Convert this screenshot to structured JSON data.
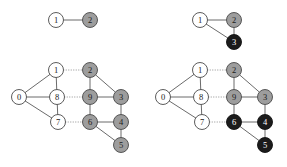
{
  "figure": {
    "background_color": "#ffffff",
    "width": 287,
    "height": 167,
    "palette": {
      "white_node_fill": "#ffffff",
      "gray_node_fill": "#9d9d9d",
      "black_node_fill": "#1b1b1b",
      "node_stroke": "#4a4a4a",
      "solid_edge": "#6b6b6b",
      "dotted_edge": "#9a9a9a",
      "label_on_light": "#1a1a1a",
      "label_on_dark": "#ffffff"
    }
  },
  "panels": [
    {
      "id": "top-left",
      "name": "graph-top-left",
      "origin": {
        "x": 0,
        "y": 0
      },
      "size": {
        "width": 143,
        "height": 55
      },
      "nodes": [
        {
          "id": "n1",
          "label": "1",
          "x": 56,
          "y": 20,
          "r": 7.5,
          "fill": "white"
        },
        {
          "id": "n2",
          "label": "2",
          "x": 90,
          "y": 20,
          "r": 7.5,
          "fill": "gray"
        }
      ],
      "edges": [
        {
          "from": "n1",
          "to": "n2",
          "style": "solid"
        }
      ]
    },
    {
      "id": "top-right",
      "name": "graph-top-right",
      "origin": {
        "x": 143,
        "y": 0
      },
      "size": {
        "width": 144,
        "height": 55
      },
      "nodes": [
        {
          "id": "n1",
          "label": "1",
          "x": 57,
          "y": 20,
          "r": 7.5,
          "fill": "white"
        },
        {
          "id": "n2",
          "label": "2",
          "x": 91,
          "y": 20,
          "r": 7.5,
          "fill": "gray"
        },
        {
          "id": "n3",
          "label": "3",
          "x": 91,
          "y": 42,
          "r": 7.5,
          "fill": "black"
        }
      ],
      "edges": [
        {
          "from": "n1",
          "to": "n2",
          "style": "solid"
        },
        {
          "from": "n1",
          "to": "n3",
          "style": "solid"
        },
        {
          "from": "n2",
          "to": "n3",
          "style": "solid"
        }
      ]
    },
    {
      "id": "bottom-left",
      "name": "graph-bottom-left",
      "origin": {
        "x": 0,
        "y": 55
      },
      "size": {
        "width": 143,
        "height": 112
      },
      "nodes": [
        {
          "id": "n0",
          "label": "0",
          "x": 19,
          "y": 42,
          "r": 7.5,
          "fill": "white"
        },
        {
          "id": "n1",
          "label": "1",
          "x": 56,
          "y": 15,
          "r": 7.5,
          "fill": "white"
        },
        {
          "id": "n8",
          "label": "8",
          "x": 57,
          "y": 42,
          "r": 7.5,
          "fill": "white"
        },
        {
          "id": "n7",
          "label": "7",
          "x": 58,
          "y": 67,
          "r": 7.5,
          "fill": "white"
        },
        {
          "id": "n2",
          "label": "2",
          "x": 90,
          "y": 15,
          "r": 7.5,
          "fill": "gray"
        },
        {
          "id": "n9",
          "label": "9",
          "x": 90,
          "y": 42,
          "r": 7.5,
          "fill": "gray"
        },
        {
          "id": "n3",
          "label": "3",
          "x": 121,
          "y": 42,
          "r": 7.5,
          "fill": "gray"
        },
        {
          "id": "n6",
          "label": "6",
          "x": 90,
          "y": 67,
          "r": 7.5,
          "fill": "gray"
        },
        {
          "id": "n4",
          "label": "4",
          "x": 121,
          "y": 67,
          "r": 7.5,
          "fill": "gray"
        },
        {
          "id": "n5",
          "label": "5",
          "x": 121,
          "y": 90,
          "r": 7.5,
          "fill": "gray"
        }
      ],
      "edges": [
        {
          "from": "n0",
          "to": "n1",
          "style": "solid"
        },
        {
          "from": "n0",
          "to": "n8",
          "style": "solid"
        },
        {
          "from": "n0",
          "to": "n7",
          "style": "solid"
        },
        {
          "from": "n1",
          "to": "n8",
          "style": "solid"
        },
        {
          "from": "n8",
          "to": "n7",
          "style": "solid"
        },
        {
          "from": "n1",
          "to": "n2",
          "style": "dotted"
        },
        {
          "from": "n8",
          "to": "n9",
          "style": "dotted"
        },
        {
          "from": "n7",
          "to": "n6",
          "style": "dotted"
        },
        {
          "from": "n2",
          "to": "n9",
          "style": "solid"
        },
        {
          "from": "n2",
          "to": "n3",
          "style": "solid"
        },
        {
          "from": "n9",
          "to": "n3",
          "style": "solid"
        },
        {
          "from": "n9",
          "to": "n6",
          "style": "solid"
        },
        {
          "from": "n3",
          "to": "n4",
          "style": "solid"
        },
        {
          "from": "n6",
          "to": "n4",
          "style": "solid"
        },
        {
          "from": "n6",
          "to": "n5",
          "style": "solid"
        },
        {
          "from": "n4",
          "to": "n5",
          "style": "solid"
        }
      ]
    },
    {
      "id": "bottom-right",
      "name": "graph-bottom-right",
      "origin": {
        "x": 143,
        "y": 55
      },
      "size": {
        "width": 144,
        "height": 112
      },
      "nodes": [
        {
          "id": "n0",
          "label": "0",
          "x": 20,
          "y": 42,
          "r": 7.5,
          "fill": "white"
        },
        {
          "id": "n1",
          "label": "1",
          "x": 57,
          "y": 15,
          "r": 7.5,
          "fill": "white"
        },
        {
          "id": "n8",
          "label": "8",
          "x": 58,
          "y": 42,
          "r": 7.5,
          "fill": "white"
        },
        {
          "id": "n7",
          "label": "7",
          "x": 59,
          "y": 67,
          "r": 7.5,
          "fill": "white"
        },
        {
          "id": "n2",
          "label": "2",
          "x": 91,
          "y": 15,
          "r": 7.5,
          "fill": "gray"
        },
        {
          "id": "n9",
          "label": "9",
          "x": 91,
          "y": 42,
          "r": 7.5,
          "fill": "gray"
        },
        {
          "id": "n3",
          "label": "3",
          "x": 122,
          "y": 42,
          "r": 7.5,
          "fill": "gray"
        },
        {
          "id": "n6",
          "label": "6",
          "x": 91,
          "y": 67,
          "r": 7.5,
          "fill": "black"
        },
        {
          "id": "n4",
          "label": "4",
          "x": 122,
          "y": 67,
          "r": 7.5,
          "fill": "black"
        },
        {
          "id": "n5",
          "label": "5",
          "x": 122,
          "y": 90,
          "r": 7.5,
          "fill": "black"
        }
      ],
      "edges": [
        {
          "from": "n0",
          "to": "n1",
          "style": "solid"
        },
        {
          "from": "n0",
          "to": "n8",
          "style": "solid"
        },
        {
          "from": "n0",
          "to": "n7",
          "style": "solid"
        },
        {
          "from": "n1",
          "to": "n8",
          "style": "solid"
        },
        {
          "from": "n8",
          "to": "n7",
          "style": "solid"
        },
        {
          "from": "n1",
          "to": "n2",
          "style": "dotted"
        },
        {
          "from": "n8",
          "to": "n9",
          "style": "dotted"
        },
        {
          "from": "n7",
          "to": "n6",
          "style": "dotted"
        },
        {
          "from": "n2",
          "to": "n9",
          "style": "solid"
        },
        {
          "from": "n2",
          "to": "n3",
          "style": "solid"
        },
        {
          "from": "n9",
          "to": "n3",
          "style": "solid"
        },
        {
          "from": "n9",
          "to": "n6",
          "style": "solid"
        },
        {
          "from": "n3",
          "to": "n4",
          "style": "solid"
        },
        {
          "from": "n6",
          "to": "n4",
          "style": "solid"
        },
        {
          "from": "n6",
          "to": "n5",
          "style": "solid"
        },
        {
          "from": "n4",
          "to": "n5",
          "style": "solid"
        }
      ]
    }
  ]
}
